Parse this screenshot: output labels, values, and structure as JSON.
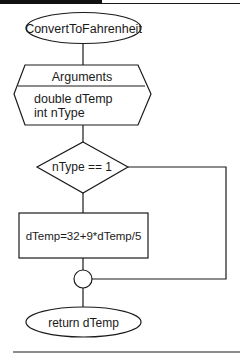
{
  "colors": {
    "stroke": "#1a1a1a",
    "header_bar": "#111111",
    "background": "#ffffff"
  },
  "flowchart": {
    "start": {
      "label": "ConvertToFahrenheit",
      "shape": "ellipse"
    },
    "arguments": {
      "header": "Arguments",
      "lines": [
        "double dTemp",
        "int nType"
      ],
      "shape": "hexagon"
    },
    "decision": {
      "label": "nType == 1",
      "shape": "diamond"
    },
    "process": {
      "label": "dTemp=32+9*dTemp/5",
      "shape": "rectangle"
    },
    "junction": {
      "shape": "circle"
    },
    "end": {
      "label": "return dTemp",
      "shape": "ellipse"
    }
  }
}
